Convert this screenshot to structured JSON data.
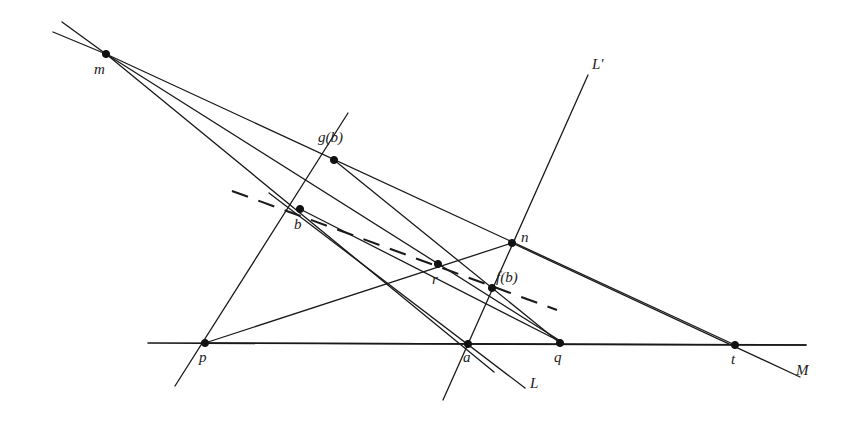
{
  "figure": {
    "background_color": "#ffffff",
    "stroke_color": "#1a1a1a",
    "width": 851,
    "height": 427
  },
  "points": [
    {
      "id": "m",
      "label": "m",
      "x": 106,
      "y": 54,
      "label_x": 94,
      "label_y": 62
    },
    {
      "id": "gb",
      "label": "g(b)",
      "x": 334,
      "y": 160,
      "label_x": 318,
      "label_y": 130
    },
    {
      "id": "b",
      "label": "b",
      "x": 300,
      "y": 209,
      "label_x": 294,
      "label_y": 217
    },
    {
      "id": "n",
      "label": "n",
      "x": 512,
      "y": 243,
      "label_x": 521,
      "label_y": 230
    },
    {
      "id": "r",
      "label": "r",
      "x": 438,
      "y": 264,
      "label_x": 432,
      "label_y": 272
    },
    {
      "id": "fb",
      "label": "f(b)",
      "x": 492,
      "y": 288,
      "label_x": 496,
      "label_y": 270
    },
    {
      "id": "p",
      "label": "p",
      "x": 205,
      "y": 343,
      "label_x": 199,
      "label_y": 350
    },
    {
      "id": "a",
      "label": "a",
      "x": 468,
      "y": 344,
      "label_x": 463,
      "label_y": 350
    },
    {
      "id": "q",
      "label": "q",
      "x": 560,
      "y": 343,
      "label_x": 554,
      "label_y": 350
    },
    {
      "id": "t",
      "label": "t",
      "x": 735,
      "y": 345,
      "label_x": 731,
      "label_y": 352
    }
  ],
  "line_labels": [
    {
      "id": "L-prime",
      "label": "L'",
      "label_x": 592,
      "label_y": 57
    },
    {
      "id": "L",
      "label": "L",
      "label_x": 530,
      "label_y": 376
    },
    {
      "id": "M",
      "label": "M",
      "label_x": 796,
      "label_y": 363
    }
  ],
  "segments": [
    {
      "id": "line-M-horizontal",
      "kind": "solid",
      "x1": 148,
      "y1": 343,
      "x2": 806,
      "y2": 345
    },
    {
      "id": "line-L-prime",
      "kind": "thin",
      "x1": 588,
      "y1": 75,
      "x2": 443,
      "y2": 400
    },
    {
      "id": "line-L-through-a",
      "kind": "thin",
      "x1": 269,
      "y1": 193,
      "x2": 525,
      "y2": 388
    },
    {
      "id": "line-m-to-upper-ray-1",
      "kind": "thin",
      "x1": 106,
      "y1": 54,
      "x2": 62,
      "y2": 22
    },
    {
      "id": "line-m-to-upper-ray-2",
      "kind": "thin",
      "x1": 106,
      "y1": 54,
      "x2": 53,
      "y2": 32
    },
    {
      "id": "line-m-through-gb",
      "kind": "thin",
      "x1": 106,
      "y1": 54,
      "x2": 735,
      "y2": 345
    },
    {
      "id": "line-m-through-b-to-q",
      "kind": "thin",
      "x1": 106,
      "y1": 54,
      "x2": 562,
      "y2": 342
    },
    {
      "id": "line-m-to-a-extended",
      "kind": "thin",
      "x1": 106,
      "y1": 54,
      "x2": 494,
      "y2": 372
    },
    {
      "id": "line-p-through-b-gb",
      "kind": "thin",
      "x1": 175,
      "y1": 386,
      "x2": 348,
      "y2": 113
    },
    {
      "id": "line-gb-to-q",
      "kind": "thin",
      "x1": 334,
      "y1": 160,
      "x2": 560,
      "y2": 343
    },
    {
      "id": "line-p-to-n-t",
      "kind": "thin",
      "x1": 205,
      "y1": 343,
      "x2": 806,
      "y2": 345
    },
    {
      "id": "line-p-to-n",
      "kind": "thin",
      "x1": 205,
      "y1": 343,
      "x2": 512,
      "y2": 243
    },
    {
      "id": "line-n-to-t",
      "kind": "thin",
      "x1": 512,
      "y1": 243,
      "x2": 800,
      "y2": 377
    },
    {
      "id": "line-b-to-q",
      "kind": "thin",
      "x1": 300,
      "y1": 209,
      "x2": 561,
      "y2": 342
    }
  ],
  "dashed_segments": [
    {
      "id": "dashed-line-through-b-fb",
      "x1": 232,
      "y1": 191,
      "x2": 557,
      "y2": 310
    }
  ]
}
